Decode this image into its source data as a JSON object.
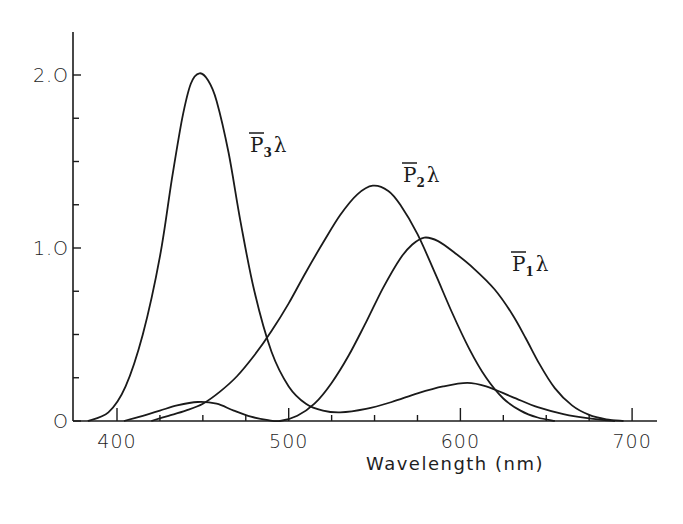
{
  "chart_data": {
    "type": "line",
    "title": "",
    "xlabel": "Wavelength (nm)",
    "ylabel": "",
    "xlim": [
      385,
      718
    ],
    "ylim": [
      0,
      2.3
    ],
    "grid": false,
    "x_ticks": {
      "major": [
        400,
        500,
        600,
        700
      ],
      "minor": [
        425,
        450,
        475,
        525,
        550,
        575,
        625,
        650,
        675
      ],
      "labels": [
        "400",
        "500",
        "600",
        "700"
      ]
    },
    "y_ticks": {
      "major": [
        0,
        1.0,
        2.0
      ],
      "minor": [
        0.25,
        0.5,
        0.75,
        1.25,
        1.5,
        1.75
      ],
      "labels": [
        "O",
        "1.O",
        "2.O"
      ]
    },
    "series": [
      {
        "name": "p̄3λ",
        "label_main": "P",
        "label_sub": "3",
        "label_suffix": "λ",
        "points": [
          [
            383,
            0
          ],
          [
            395,
            0.05
          ],
          [
            405,
            0.2
          ],
          [
            415,
            0.5
          ],
          [
            425,
            0.95
          ],
          [
            432,
            1.4
          ],
          [
            438,
            1.75
          ],
          [
            443,
            1.95
          ],
          [
            448,
            2.01
          ],
          [
            453,
            1.97
          ],
          [
            458,
            1.85
          ],
          [
            465,
            1.55
          ],
          [
            472,
            1.15
          ],
          [
            480,
            0.75
          ],
          [
            490,
            0.4
          ],
          [
            500,
            0.2
          ],
          [
            510,
            0.1
          ],
          [
            520,
            0.06
          ],
          [
            530,
            0.05
          ],
          [
            545,
            0.07
          ],
          [
            560,
            0.11
          ],
          [
            575,
            0.16
          ],
          [
            590,
            0.2
          ],
          [
            604,
            0.22
          ],
          [
            615,
            0.2
          ],
          [
            630,
            0.14
          ],
          [
            645,
            0.08
          ],
          [
            660,
            0.04
          ],
          [
            675,
            0.015
          ],
          [
            690,
            0
          ]
        ],
        "label_pos": [
          250,
          152
        ]
      },
      {
        "name": "p̄2λ",
        "label_main": "P",
        "label_sub": "2",
        "label_suffix": "λ",
        "points": [
          [
            420,
            0
          ],
          [
            430,
            0.03
          ],
          [
            440,
            0.06
          ],
          [
            450,
            0.1
          ],
          [
            460,
            0.17
          ],
          [
            470,
            0.26
          ],
          [
            480,
            0.38
          ],
          [
            490,
            0.52
          ],
          [
            500,
            0.68
          ],
          [
            510,
            0.86
          ],
          [
            520,
            1.03
          ],
          [
            530,
            1.19
          ],
          [
            540,
            1.31
          ],
          [
            549,
            1.36
          ],
          [
            558,
            1.33
          ],
          [
            565,
            1.25
          ],
          [
            575,
            1.08
          ],
          [
            585,
            0.86
          ],
          [
            595,
            0.63
          ],
          [
            605,
            0.42
          ],
          [
            615,
            0.25
          ],
          [
            625,
            0.13
          ],
          [
            635,
            0.06
          ],
          [
            645,
            0.02
          ],
          [
            655,
            0
          ]
        ],
        "label_pos": [
          403,
          182
        ]
      },
      {
        "name": "p̄1λ",
        "label_main": "P",
        "label_sub": "1",
        "label_suffix": "λ",
        "points": [
          [
            404,
            0
          ],
          [
            415,
            0.03
          ],
          [
            425,
            0.06
          ],
          [
            435,
            0.09
          ],
          [
            447,
            0.11
          ],
          [
            458,
            0.1
          ],
          [
            468,
            0.06
          ],
          [
            478,
            0.025
          ],
          [
            488,
            0.005
          ],
          [
            495,
            0
          ],
          [
            505,
            0.03
          ],
          [
            515,
            0.1
          ],
          [
            525,
            0.22
          ],
          [
            535,
            0.38
          ],
          [
            545,
            0.57
          ],
          [
            555,
            0.77
          ],
          [
            565,
            0.94
          ],
          [
            572,
            1.02
          ],
          [
            579,
            1.06
          ],
          [
            587,
            1.04
          ],
          [
            597,
            0.97
          ],
          [
            608,
            0.88
          ],
          [
            620,
            0.76
          ],
          [
            630,
            0.62
          ],
          [
            638,
            0.48
          ],
          [
            646,
            0.33
          ],
          [
            655,
            0.19
          ],
          [
            665,
            0.09
          ],
          [
            675,
            0.035
          ],
          [
            685,
            0.01
          ],
          [
            695,
            0
          ]
        ],
        "label_pos": [
          512,
          271
        ]
      }
    ],
    "annotations": [
      "p̄3λ",
      "p̄2λ",
      "p̄1λ"
    ]
  },
  "layout": {
    "plot_origin_px": [
      73,
      421
    ],
    "x_px_per_unit": 1.717,
    "x_zero_value": 400,
    "x_zero_px": 117,
    "y_px_per_unit": 173,
    "axis_top_px": 32,
    "axis_right_px": 657
  }
}
